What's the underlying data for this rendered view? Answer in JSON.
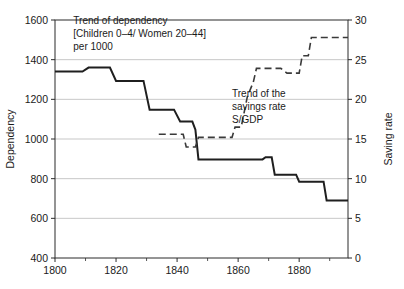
{
  "chart_data": {
    "type": "line",
    "title": "",
    "xlabel": "",
    "ylabel": "Dependency",
    "y2label": "Saving rate",
    "xlim": [
      1800,
      1896
    ],
    "ylim": [
      400,
      1600
    ],
    "y2lim": [
      0,
      30
    ],
    "grid": true,
    "legend_position": "inline-annotation",
    "x_ticks": [
      1800,
      1820,
      1840,
      1860,
      1880
    ],
    "x_minor_ticks": [
      1810,
      1830,
      1850,
      1870,
      1890
    ],
    "y_ticks": [
      400,
      600,
      800,
      1000,
      1200,
      1400,
      1600
    ],
    "y2_ticks": [
      0,
      5,
      10,
      15,
      20,
      25,
      30
    ],
    "series": [
      {
        "name": "Trend of dependency",
        "style": "solid",
        "axis": "left",
        "interpolation": "step",
        "color": "#1f1f1f",
        "points": [
          [
            1800,
            1340
          ],
          [
            1809,
            1340
          ],
          [
            1811,
            1360
          ],
          [
            1818,
            1360
          ],
          [
            1820,
            1293
          ],
          [
            1829,
            1293
          ],
          [
            1831,
            1148
          ],
          [
            1839,
            1148
          ],
          [
            1841,
            1088
          ],
          [
            1845,
            1088
          ],
          [
            1846,
            1047
          ],
          [
            1847,
            897
          ],
          [
            1868,
            897
          ],
          [
            1869,
            908
          ],
          [
            1871,
            908
          ],
          [
            1872,
            820
          ],
          [
            1879,
            820
          ],
          [
            1880,
            785
          ],
          [
            1888,
            785
          ],
          [
            1889,
            690
          ],
          [
            1896,
            690
          ]
        ]
      },
      {
        "name": "Trend of the savings rate S/GDP",
        "style": "dashed",
        "axis": "right",
        "interpolation": "step",
        "color": "#3a3a3a",
        "points": [
          [
            1834,
            15.6
          ],
          [
            1842,
            15.6
          ],
          [
            1843,
            14.0
          ],
          [
            1846,
            14.0
          ],
          [
            1847,
            15.2
          ],
          [
            1858,
            15.2
          ],
          [
            1859,
            16.5
          ],
          [
            1861,
            16.5
          ],
          [
            1863,
            20.3
          ],
          [
            1865,
            22.2
          ],
          [
            1866,
            23.9
          ],
          [
            1874,
            23.9
          ],
          [
            1876,
            23.3
          ],
          [
            1880,
            23.3
          ],
          [
            1881,
            25.5
          ],
          [
            1883,
            25.5
          ],
          [
            1884,
            27.8
          ],
          [
            1896,
            27.8
          ]
        ]
      }
    ],
    "annotations": [
      {
        "name": "dependency-annotation",
        "lines": [
          "Trend of dependency",
          "[Children 0–4/ Women 20–44]",
          "per 1000"
        ],
        "x": 1806,
        "y": 1578
      },
      {
        "name": "savings-annotation",
        "lines": [
          "Trend of the",
          "savings rate",
          "S/GDP"
        ],
        "x": 1858,
        "y": 1212
      }
    ]
  }
}
